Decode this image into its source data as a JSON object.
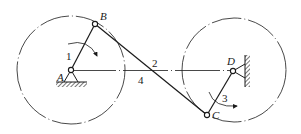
{
  "diagram": {
    "type": "four-bar linkage (crank-rocker / double-crank)",
    "colors": {
      "ink": "#1a1a1a",
      "background": "#ffffff"
    },
    "joints": {
      "A": {
        "label": "A",
        "x": 71,
        "y": 70,
        "fixed": true
      },
      "B": {
        "label": "B",
        "x": 95,
        "y": 24
      },
      "C": {
        "label": "C",
        "x": 207,
        "y": 115
      },
      "D": {
        "label": "D",
        "x": 233,
        "y": 71,
        "fixed": true
      }
    },
    "links": [
      {
        "number": "1",
        "from": "A",
        "to": "B",
        "role": "crank"
      },
      {
        "number": "2",
        "from": "B",
        "to": "C",
        "role": "coupler"
      },
      {
        "number": "3",
        "from": "D",
        "to": "C",
        "role": "rocker"
      },
      {
        "number": "4",
        "from": "A",
        "to": "D",
        "role": "frame"
      }
    ],
    "labels": {
      "A": "A",
      "B": "B",
      "C": "C",
      "D": "D",
      "link1": "1",
      "link2": "2",
      "link3": "3",
      "link4": "4"
    },
    "circles": [
      {
        "center": "A",
        "radius": 54,
        "style": "dash-dot"
      },
      {
        "center": "D",
        "radius": 53,
        "style": "dash-dot"
      }
    ]
  }
}
